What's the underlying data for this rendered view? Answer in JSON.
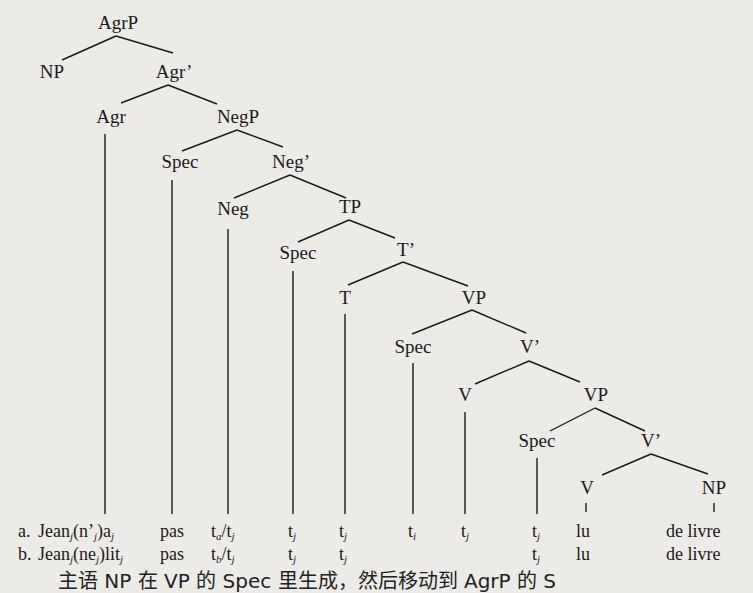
{
  "tree": {
    "nodes": {
      "agrp": "AgrP",
      "np_subj": "NP",
      "agr_bar": "Agr’",
      "agr": "Agr",
      "negp": "NegP",
      "spec_neg": "Spec",
      "neg_bar": "Neg’",
      "neg": "Neg",
      "tp": "TP",
      "spec_t": "Spec",
      "t_bar": "T’",
      "t": "T",
      "vp1": "VP",
      "spec_v1": "Spec",
      "v_bar1": "V’",
      "v1": "V",
      "vp2": "VP",
      "spec_v2": "Spec",
      "v_bar2": "V’",
      "v2": "V",
      "np_obj": "NP"
    }
  },
  "examples": {
    "a": {
      "label": "a.",
      "col1_base": "Jean",
      "col1_sub": "j",
      "col1_mid": "(n’",
      "col1_sub2": "j",
      "col1_mid2": ")a",
      "col1_sub3": "j",
      "col2": "pas",
      "col3_base": "t",
      "col3_sub": "a",
      "col3_rest": "/t",
      "col3_sub2": "j",
      "col4": "t",
      "col4_sub": "j",
      "col5": "t",
      "col5_sub": "j",
      "col6": "t",
      "col6_sub": "i",
      "col7": "t",
      "col7_sub": "j",
      "col8": "t",
      "col8_sub": "j",
      "col9": "lu",
      "col10": "de livre"
    },
    "b": {
      "label": "b.",
      "col1_base": "Jean",
      "col1_sub": "j",
      "col1_mid": "(ne",
      "col1_sub2": "j",
      "col1_mid2": ")lit",
      "col1_sub3": "j",
      "col2": "pas",
      "col3_base": "t",
      "col3_sub": "b",
      "col3_rest": "/t",
      "col3_sub2": "j",
      "col4": "t",
      "col4_sub": "j",
      "col5": "t",
      "col5_sub": "j",
      "col8": "t",
      "col8_sub": "j",
      "col9": "lu",
      "col10": "de livre"
    }
  },
  "caption_partial": "主语 NP 在 VP 的 Spec 里生成，然后移动到 AgrP 的 S"
}
